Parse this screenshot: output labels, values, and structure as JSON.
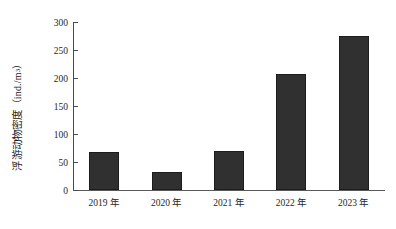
{
  "chart_data": {
    "type": "bar",
    "title": "",
    "xlabel": "",
    "ylabel": "浮游动物密度（ind./m³）",
    "ylabel_text": "浮游动物密度",
    "ylabel_unit_prefix": "（ind./m",
    "ylabel_unit_exponent": "3",
    "ylabel_unit_suffix": "）",
    "categories": [
      "2019 年",
      "2020 年",
      "2021 年",
      "2022 年",
      "2023 年"
    ],
    "values": [
      68,
      32,
      70,
      207,
      275
    ],
    "ylim": [
      0,
      300
    ],
    "yticks": [
      0,
      50,
      100,
      150,
      200,
      250,
      300
    ],
    "ytick_labels": [
      "0",
      "50",
      "100",
      "150",
      "200",
      "250",
      "300"
    ],
    "grid": false,
    "legend": null,
    "series": [
      {
        "name": "浮游动物密度",
        "color": "#303030",
        "values": [
          68,
          32,
          70,
          207,
          275
        ]
      }
    ]
  },
  "axis": {
    "y_title_chars": "浮游动物密度",
    "y_unit_open": "（ind./m",
    "y_unit_exp": "3",
    "y_unit_close": "）"
  },
  "ticks": {
    "y": [
      "300",
      "250",
      "200",
      "150",
      "100",
      "50",
      "0"
    ]
  }
}
